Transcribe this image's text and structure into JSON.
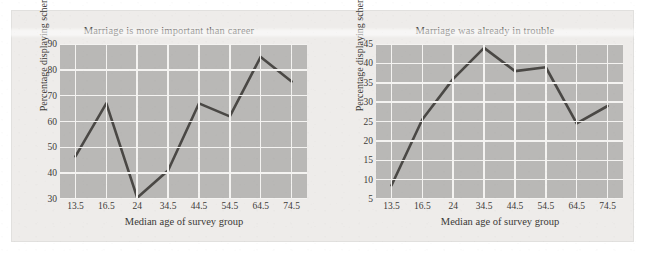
{
  "figure": {
    "background_color": "#eeecea",
    "plot_background_color": "#b9b8b6",
    "gridline_color": "#f4f3f1",
    "line_color": "#4a4845"
  },
  "charts": [
    {
      "id": "marriage-more-important-than-career",
      "title": "Marriage is more important than career",
      "xlabel": "Median age of survey group",
      "ylabel": "Percentage displaying schema",
      "categories": [
        "13.5",
        "16.5",
        "24",
        "34.5",
        "44.5",
        "54.5",
        "64.5",
        "74.5"
      ],
      "values": [
        46.5,
        67,
        30.5,
        41,
        67,
        62,
        85,
        75.5
      ],
      "yticks": [
        "30",
        "40",
        "50",
        "60",
        "70",
        "80",
        "90"
      ],
      "ylim": [
        30,
        90
      ]
    },
    {
      "id": "marriage-already-in-trouble",
      "title": "Marriage was already in trouble",
      "xlabel": "Median age of survey group",
      "ylabel": "Percentage displaying schema",
      "categories": [
        "13.5",
        "16.5",
        "24",
        "34.5",
        "44.5",
        "54.5",
        "64.5",
        "74.5"
      ],
      "values": [
        8.5,
        25.5,
        36,
        44,
        38,
        39,
        24.5,
        29
      ],
      "yticks": [
        "5",
        "10",
        "15",
        "20",
        "25",
        "30",
        "35",
        "40",
        "45"
      ],
      "ylim": [
        5,
        45
      ]
    }
  ],
  "chart_data": [
    {
      "type": "line",
      "title": "Marriage is more important than career",
      "xlabel": "Median age of survey group",
      "ylabel": "Percentage displaying schema",
      "categories": [
        "13.5",
        "16.5",
        "24",
        "34.5",
        "44.5",
        "54.5",
        "64.5",
        "74.5"
      ],
      "x": [
        13.5,
        16.5,
        24,
        34.5,
        44.5,
        54.5,
        64.5,
        74.5
      ],
      "values": [
        46.5,
        67,
        30.5,
        41,
        67,
        62,
        85,
        75.5
      ],
      "ylim": [
        30,
        90
      ],
      "yticks": [
        30,
        40,
        50,
        60,
        70,
        80,
        90
      ],
      "grid": true,
      "legend": "none"
    },
    {
      "type": "line",
      "title": "Marriage was already in trouble",
      "xlabel": "Median age of survey group",
      "ylabel": "Percentage displaying schema",
      "categories": [
        "13.5",
        "16.5",
        "24",
        "34.5",
        "44.5",
        "54.5",
        "64.5",
        "74.5"
      ],
      "x": [
        13.5,
        16.5,
        24,
        34.5,
        44.5,
        54.5,
        64.5,
        74.5
      ],
      "values": [
        8.5,
        25.5,
        36,
        44,
        38,
        39,
        24.5,
        29
      ],
      "ylim": [
        5,
        45
      ],
      "yticks": [
        5,
        10,
        15,
        20,
        25,
        30,
        35,
        40,
        45
      ],
      "grid": true,
      "legend": "none"
    }
  ]
}
